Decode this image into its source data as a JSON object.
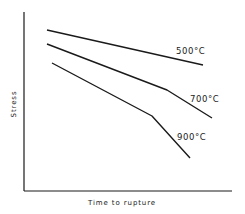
{
  "chart_data": {
    "type": "line",
    "title": "",
    "xlabel": "Time to rupture",
    "ylabel": "Stress",
    "grid": false,
    "legend": "none (inline curve labels)",
    "series": [
      {
        "name": "500°C",
        "label": "500°C",
        "points": [
          [
            47,
            30
          ],
          [
            203,
            65
          ]
        ]
      },
      {
        "name": "700°C",
        "label": "700°C",
        "points": [
          [
            47,
            44
          ],
          [
            167,
            90
          ],
          [
            212,
            118
          ]
        ]
      },
      {
        "name": "900°C",
        "label": "900°C",
        "points": [
          [
            52,
            63
          ],
          [
            152,
            116
          ],
          [
            190,
            158
          ]
        ]
      }
    ],
    "note": "Qualitative schematic; no numeric tick labels. Points are in pixel coordinates."
  },
  "axes": {
    "x_label": "Time to rupture",
    "y_label": "Stress"
  },
  "curve_labels": {
    "c500": "500°C",
    "c700": "700°C",
    "c900": "900°C"
  }
}
